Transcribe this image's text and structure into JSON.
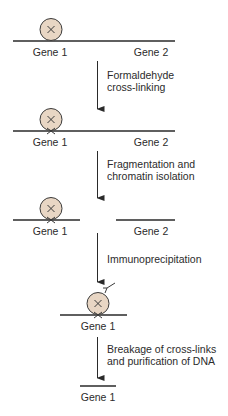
{
  "colors": {
    "line": "#2a2a2a",
    "protein_fill": "#e8d6c4",
    "protein_stroke": "#3a3a3a",
    "text": "#2b2b2b"
  },
  "stages": [
    {
      "genes": [
        {
          "label": "Gene 1"
        },
        {
          "label": "Gene 2"
        }
      ],
      "protein": "bound protein (not cross-linked)"
    },
    {
      "genes": [
        {
          "label": "Gene 1"
        },
        {
          "label": "Gene 2"
        }
      ],
      "protein": "cross-linked protein"
    },
    {
      "genes": [
        {
          "label": "Gene 1"
        },
        {
          "label": "Gene 2"
        }
      ],
      "protein": "cross-linked protein on fragmented chromatin"
    },
    {
      "genes": [
        {
          "label": "Gene 1"
        }
      ],
      "protein": "cross-linked protein bound by antibody"
    },
    {
      "genes": [
        {
          "label": "Gene 1"
        }
      ],
      "protein": "purified DNA"
    }
  ],
  "steps": [
    {
      "line1": "Formaldehyde",
      "line2": "cross-linking"
    },
    {
      "line1": "Fragmentation and",
      "line2": "chromatin isolation"
    },
    {
      "line1": "Immunoprecipitation",
      "line2": ""
    },
    {
      "line1": "Breakage of cross-links",
      "line2": "and purification of DNA"
    }
  ]
}
